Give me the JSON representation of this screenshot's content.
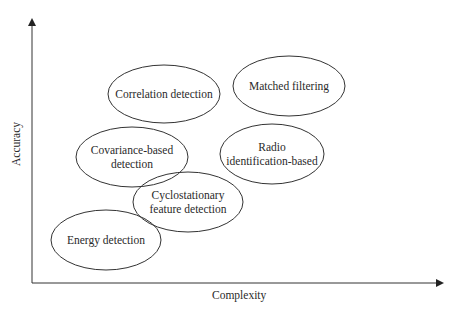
{
  "diagram": {
    "x_axis": {
      "label": "Complexity"
    },
    "y_axis": {
      "label": "Accuracy"
    },
    "nodes": [
      {
        "id": "correlation",
        "lines": [
          "Correlation detection"
        ],
        "cx": 164,
        "cy": 94,
        "rx": 56,
        "ry": 29
      },
      {
        "id": "matched",
        "lines": [
          "Matched filtering"
        ],
        "cx": 289,
        "cy": 86,
        "rx": 56,
        "ry": 30
      },
      {
        "id": "covariance",
        "lines": [
          "Covariance-based",
          "detection"
        ],
        "cx": 132,
        "cy": 157,
        "rx": 56,
        "ry": 30
      },
      {
        "id": "radio",
        "lines": [
          "Radio",
          "identification-based"
        ],
        "cx": 272,
        "cy": 154,
        "rx": 52,
        "ry": 30
      },
      {
        "id": "cyclostationary",
        "lines": [
          "Cyclostationary",
          "feature detection"
        ],
        "cx": 188,
        "cy": 202,
        "rx": 55,
        "ry": 30
      },
      {
        "id": "energy",
        "lines": [
          "Energy detection"
        ],
        "cx": 106,
        "cy": 240,
        "rx": 55,
        "ry": 30
      }
    ],
    "colors": {
      "stroke": "#333333",
      "text": "#2a2a2a",
      "background": "#ffffff"
    }
  }
}
